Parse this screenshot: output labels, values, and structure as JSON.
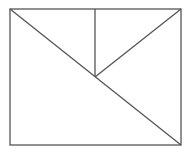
{
  "diagram": {
    "stroke_color": "#555555",
    "background": "#ffffff",
    "rectangle": {
      "x1": 10,
      "y1": 9,
      "x2": 181,
      "y2": 145
    },
    "lines": [
      {
        "name": "main-diagonal",
        "x1": 10,
        "y1": 9,
        "x2": 181,
        "y2": 145
      },
      {
        "name": "vertical-segment",
        "x1": 95,
        "y1": 9,
        "x2": 95,
        "y2": 77
      },
      {
        "name": "right-diagonal",
        "x1": 95,
        "y1": 77,
        "x2": 181,
        "y2": 9
      }
    ]
  }
}
